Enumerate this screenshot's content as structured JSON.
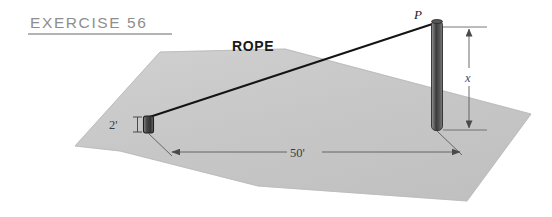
{
  "figure": {
    "title": "EXERCISE 56",
    "rope_label": "ROPE",
    "point_label": "P",
    "height_label": "x",
    "post_height_label": "2'",
    "ground_distance_label": "50'",
    "colors": {
      "ground_fill": "#c9c9c9",
      "ground_edge": "#bdbdbd",
      "title_text": "#8e8e8e",
      "title_rule": "#9a9a9a",
      "rope_line": "#141414",
      "pole_dark": "#3a3a3a",
      "pole_light": "#8e8e8e",
      "dimension_line": "#555555",
      "label_text": "#1a1a1a"
    }
  }
}
